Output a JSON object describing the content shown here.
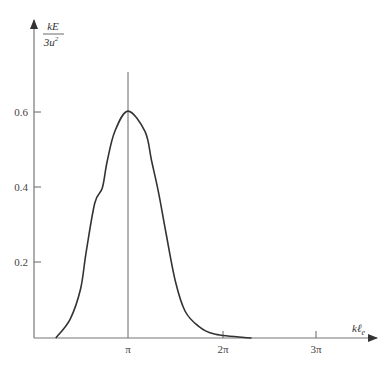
{
  "chart_data": {
    "type": "line",
    "title": "",
    "xlabel": "kℓ_e",
    "ylabel": "kE/3u²",
    "ylabel_numerator": "kE",
    "ylabel_denominator": "3u²",
    "x_units": "π",
    "xlim": [
      0,
      3.6
    ],
    "ylim": [
      0,
      0.8
    ],
    "grid": false,
    "legend": null,
    "x_ticks": [
      {
        "value": 1,
        "label": "π"
      },
      {
        "value": 2,
        "label": "2π"
      },
      {
        "value": 3,
        "label": "3π"
      }
    ],
    "y_ticks": [
      {
        "value": 0.2,
        "label": "0.2"
      },
      {
        "value": 0.4,
        "label": "0.4"
      },
      {
        "value": 0.6,
        "label": "0.6"
      }
    ],
    "annotations": [
      {
        "type": "vertical-line",
        "x": 1,
        "label": "x = π reference line"
      }
    ],
    "series": [
      {
        "name": "kE/3u²",
        "x": [
          0.24,
          0.39,
          0.5,
          0.56,
          0.65,
          0.73,
          0.78,
          0.86,
          1.0,
          1.18,
          1.25,
          1.32,
          1.4,
          1.5,
          1.6,
          1.74,
          1.92,
          2.3
        ],
        "values": [
          0.0,
          0.05,
          0.13,
          0.23,
          0.36,
          0.4,
          0.47,
          0.55,
          0.605,
          0.55,
          0.47,
          0.39,
          0.28,
          0.15,
          0.072,
          0.032,
          0.01,
          0.0
        ]
      }
    ]
  },
  "axes": {
    "x_label_main": "kℓ",
    "x_label_sub": "e",
    "y_label_num": "kE",
    "y_label_den_base": "3u",
    "y_label_den_sup": "2",
    "tick_pi": "π",
    "tick_2pi": "2π",
    "tick_3pi": "3π",
    "tick_02": "0.2",
    "tick_04": "0.4",
    "tick_06": "0.6"
  }
}
